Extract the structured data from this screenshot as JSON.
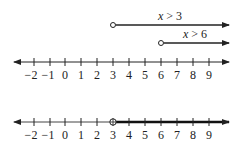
{
  "diagram": {
    "title": "",
    "colors": {
      "line": "#222222",
      "background": "#ffffff"
    },
    "number_lines": [
      {
        "id": "top",
        "tick_labels": [
          "−2",
          "−1",
          "0",
          "1",
          "2",
          "3",
          "4",
          "5",
          "6",
          "7",
          "8",
          "9"
        ],
        "rays": [
          {
            "label": "x > 3",
            "start": 3,
            "endpoint": "open",
            "direction": "right"
          },
          {
            "label": "x > 6",
            "start": 6,
            "endpoint": "open",
            "direction": "right"
          }
        ]
      },
      {
        "id": "bottom",
        "tick_labels": [
          "−2",
          "−1",
          "0",
          "1",
          "2",
          "3",
          "4",
          "5",
          "6",
          "7",
          "8",
          "9"
        ],
        "solution": {
          "start": 3,
          "endpoint": "open",
          "direction": "right",
          "highlighted": true
        }
      }
    ]
  }
}
